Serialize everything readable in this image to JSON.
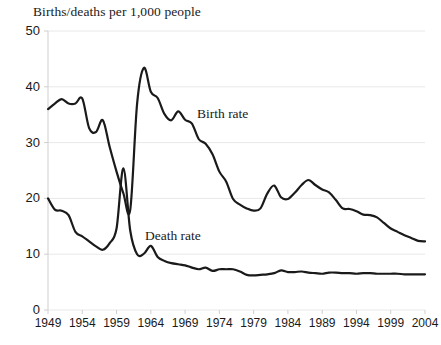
{
  "chart_data": {
    "type": "line",
    "title": "Births/deaths per 1,000 people",
    "xlabel": "",
    "ylabel": "",
    "xlim": [
      1949,
      2004
    ],
    "ylim": [
      0,
      50
    ],
    "grid": true,
    "legend_position": "inline-annotations",
    "y_ticks": [
      0,
      10,
      20,
      30,
      40,
      50
    ],
    "x_ticks": [
      1949,
      1954,
      1959,
      1964,
      1969,
      1974,
      1979,
      1984,
      1989,
      1994,
      1999,
      2004
    ],
    "annotations": [
      {
        "text": "Birth rate",
        "x": 1971,
        "y": 31
      },
      {
        "text": "Death rate",
        "x": 1964,
        "y": 13.5
      }
    ],
    "line_color": "#1a1a1a",
    "grid_color": "#e8e8e8",
    "axis_color": "#cfcfcf",
    "x": [
      1949,
      1950,
      1951,
      1952,
      1953,
      1954,
      1955,
      1956,
      1957,
      1958,
      1959,
      1960,
      1961,
      1962,
      1963,
      1964,
      1965,
      1966,
      1967,
      1968,
      1969,
      1970,
      1971,
      1972,
      1973,
      1974,
      1975,
      1976,
      1977,
      1978,
      1979,
      1980,
      1981,
      1982,
      1983,
      1984,
      1985,
      1986,
      1987,
      1988,
      1989,
      1990,
      1991,
      1992,
      1993,
      1994,
      1995,
      1996,
      1997,
      1998,
      1999,
      2000,
      2001,
      2002,
      2003,
      2004
    ],
    "series": [
      {
        "name": "Birth rate",
        "values": [
          36.0,
          37.0,
          37.8,
          37.0,
          37.0,
          37.9,
          32.6,
          31.9,
          34.0,
          29.2,
          24.8,
          20.9,
          18.0,
          37.0,
          43.4,
          39.1,
          38.0,
          35.1,
          34.0,
          35.6,
          34.1,
          33.4,
          30.6,
          29.8,
          27.9,
          24.8,
          23.0,
          19.9,
          18.9,
          18.2,
          17.8,
          18.2,
          20.9,
          22.3,
          20.2,
          19.9,
          21.0,
          22.4,
          23.3,
          22.4,
          21.6,
          21.1,
          19.7,
          18.2,
          18.1,
          17.7,
          17.1,
          17.0,
          16.6,
          15.6,
          14.6,
          14.0,
          13.4,
          12.9,
          12.4,
          12.3
        ]
      },
      {
        "name": "Death rate",
        "values": [
          20.0,
          18.0,
          17.8,
          17.0,
          14.0,
          13.2,
          12.3,
          11.4,
          10.8,
          12.0,
          14.6,
          25.4,
          14.2,
          10.0,
          10.1,
          11.5,
          9.5,
          8.8,
          8.4,
          8.2,
          8.0,
          7.6,
          7.3,
          7.6,
          7.0,
          7.3,
          7.3,
          7.3,
          6.9,
          6.3,
          6.2,
          6.3,
          6.4,
          6.6,
          7.1,
          6.8,
          6.8,
          6.9,
          6.7,
          6.6,
          6.5,
          6.7,
          6.7,
          6.6,
          6.6,
          6.5,
          6.6,
          6.6,
          6.5,
          6.5,
          6.5,
          6.5,
          6.4,
          6.4,
          6.4,
          6.4
        ]
      }
    ]
  }
}
